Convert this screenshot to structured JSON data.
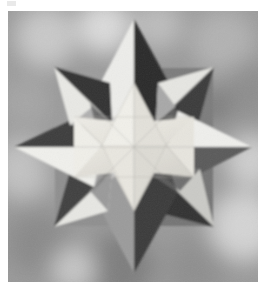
{
  "image": {
    "title": "Stellated polyhedron paper sculpture",
    "subject": "eight-pointed stellated polyhedron",
    "medium": "black and white photograph",
    "frame": {
      "x": 8,
      "y": 11,
      "width": 250,
      "height": 271
    },
    "corner_mark": {
      "x": 7,
      "y": 1,
      "width": 9,
      "height": 5,
      "color": "#e9e9e9"
    },
    "background": {
      "description": "blurred mottled gray out-of-focus backdrop",
      "base_color": "#9a9a9a",
      "light_color": "#d8d8d8",
      "dark_color": "#6a6a6a",
      "blobs": [
        {
          "cx": 38,
          "cy": 26,
          "r": 30,
          "tone": "#c9c9c9"
        },
        {
          "cx": 96,
          "cy": 16,
          "r": 26,
          "tone": "#dcdcdc"
        },
        {
          "cx": 150,
          "cy": 14,
          "r": 24,
          "tone": "#bdbdbd"
        },
        {
          "cx": 215,
          "cy": 30,
          "r": 32,
          "tone": "#b2b2b2"
        },
        {
          "cx": 242,
          "cy": 78,
          "r": 28,
          "tone": "#8e8e8e"
        },
        {
          "cx": 18,
          "cy": 92,
          "r": 26,
          "tone": "#a6a6a6"
        },
        {
          "cx": 14,
          "cy": 158,
          "r": 30,
          "tone": "#c2c2c2"
        },
        {
          "cx": 244,
          "cy": 150,
          "r": 26,
          "tone": "#cfcfcf"
        },
        {
          "cx": 236,
          "cy": 215,
          "r": 34,
          "tone": "#d4d4d4"
        },
        {
          "cx": 30,
          "cy": 232,
          "r": 32,
          "tone": "#8a8a8a"
        },
        {
          "cx": 112,
          "cy": 256,
          "r": 34,
          "tone": "#7e7e7e"
        },
        {
          "cx": 186,
          "cy": 258,
          "r": 30,
          "tone": "#8f8f8f"
        },
        {
          "cx": 66,
          "cy": 258,
          "r": 22,
          "tone": "#c7c7c7"
        },
        {
          "cx": 205,
          "cy": 96,
          "r": 18,
          "tone": "#7c7c7c"
        }
      ]
    },
    "star": {
      "center": {
        "x": 126,
        "y": 136
      },
      "point_count": 8,
      "outer_radius_axial": 118,
      "outer_radius_diagonal": 108,
      "inner_radius": 56,
      "core_radius": 44,
      "tones": {
        "highlight": "#f0f0ec",
        "light": "#dedede",
        "mid_light": "#bcbcbc",
        "mid": "#8f8f8f",
        "mid_dark": "#5e5e5e",
        "dark": "#3a3a3a",
        "darkest": "#1d1d1d",
        "core_bright": "#eceae4",
        "core_soft": "#dcdad4"
      },
      "tips": [
        {
          "name": "north",
          "x": 126,
          "y": 8
        },
        {
          "name": "northeast",
          "x": 206,
          "y": 56
        },
        {
          "name": "east",
          "x": 244,
          "y": 136
        },
        {
          "name": "southeast",
          "x": 206,
          "y": 216
        },
        {
          "name": "south",
          "x": 126,
          "y": 262
        },
        {
          "name": "southwest",
          "x": 46,
          "y": 216
        },
        {
          "name": "west",
          "x": 6,
          "y": 136
        },
        {
          "name": "northwest",
          "x": 46,
          "y": 56
        }
      ]
    }
  }
}
